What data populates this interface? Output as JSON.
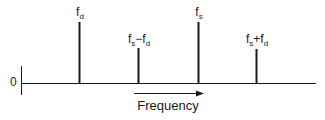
{
  "diagram": {
    "type": "frequency-spectrum",
    "origin_label": "0",
    "axis_title": "Frequency",
    "colors": {
      "line": "#1a1a1a",
      "background": "#ffffff"
    },
    "spikes": [
      {
        "id": "fd",
        "label_main": "f",
        "label_sub": "d",
        "label_op": "",
        "label_main2": "",
        "label_sub2": "",
        "x": 79,
        "top": 22,
        "relative_height": "tall"
      },
      {
        "id": "fs-minus-fd",
        "label_main": "f",
        "label_sub": "s",
        "label_op": "−",
        "label_main2": "f",
        "label_sub2": "d",
        "x": 138,
        "top": 48,
        "relative_height": "short"
      },
      {
        "id": "fs",
        "label_main": "f",
        "label_sub": "s",
        "label_op": "",
        "label_main2": "",
        "label_sub2": "",
        "x": 198,
        "top": 22,
        "relative_height": "tall"
      },
      {
        "id": "fs-plus-fd",
        "label_main": "f",
        "label_sub": "s",
        "label_op": "+",
        "label_main2": "f",
        "label_sub2": "d",
        "x": 256,
        "top": 49,
        "relative_height": "short"
      }
    ]
  }
}
